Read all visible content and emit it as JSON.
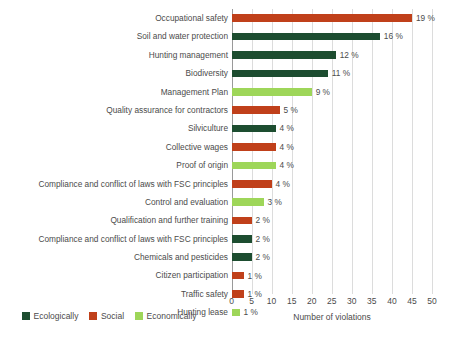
{
  "chart_data": {
    "type": "bar",
    "orientation": "horizontal",
    "title": "",
    "xlabel": "Number of violations",
    "ylabel": "",
    "xlim": [
      0,
      50
    ],
    "xticks": [
      0,
      5,
      10,
      15,
      20,
      25,
      30,
      35,
      40,
      45,
      50
    ],
    "grid": true,
    "legend_position": "bottom-left",
    "categories": [
      "Occupational safety",
      "Soil and water protection",
      "Hunting management",
      "Biodiversity",
      "Management Plan",
      "Quality assurance for contractors",
      "Silviculture",
      "Collective wages",
      "Proof of origin",
      "Compliance and conflict of laws with FSC principles",
      "Control and evaluation",
      "Qualification and further training",
      "Compliance and conflict of laws with FSC principles",
      "Chemicals and pesticides",
      "Citizen participation",
      "Traffic safety",
      "Hunting lease"
    ],
    "values": [
      45,
      37,
      26,
      24,
      20,
      12,
      11,
      11,
      11,
      10,
      8,
      5,
      5,
      5,
      3,
      3,
      2
    ],
    "data_labels": [
      "19 %",
      "16 %",
      "12 %",
      "11 %",
      "9 %",
      "5 %",
      "4 %",
      "4 %",
      "4 %",
      "4 %",
      "3 %",
      "2 %",
      "2 %",
      "2 %",
      "1 %",
      "1 %",
      "1 %"
    ],
    "group_by_bar": [
      "social",
      "ecologically",
      "ecologically",
      "ecologically",
      "economically",
      "social",
      "ecologically",
      "social",
      "economically",
      "social",
      "economically",
      "social",
      "ecologically",
      "ecologically",
      "social",
      "social",
      "economically"
    ],
    "series": [
      {
        "name": "Ecologically",
        "color": "#1d4d30",
        "points": [
          {
            "category": "Soil and water protection",
            "value": 37,
            "label": "16 %"
          },
          {
            "category": "Hunting management",
            "value": 26,
            "label": "12 %"
          },
          {
            "category": "Biodiversity",
            "value": 24,
            "label": "11 %"
          },
          {
            "category": "Silviculture",
            "value": 11,
            "label": "4 %"
          },
          {
            "category": "Compliance and conflict of laws with FSC principles",
            "value": 5,
            "label": "2 %"
          },
          {
            "category": "Chemicals and pesticides",
            "value": 5,
            "label": "2 %"
          }
        ]
      },
      {
        "name": "Social",
        "color": "#c0401a",
        "points": [
          {
            "category": "Occupational safety",
            "value": 45,
            "label": "19 %"
          },
          {
            "category": "Quality assurance for contractors",
            "value": 12,
            "label": "5 %"
          },
          {
            "category": "Collective wages",
            "value": 11,
            "label": "4 %"
          },
          {
            "category": "Compliance and conflict of laws with FSC principles",
            "value": 10,
            "label": "4 %"
          },
          {
            "category": "Qualification and further training",
            "value": 5,
            "label": "2 %"
          },
          {
            "category": "Citizen participation",
            "value": 3,
            "label": "1 %"
          },
          {
            "category": "Traffic safety",
            "value": 3,
            "label": "1 %"
          }
        ]
      },
      {
        "name": "Economically",
        "color": "#9ed659",
        "points": [
          {
            "category": "Management Plan",
            "value": 20,
            "label": "9 %"
          },
          {
            "category": "Proof of origin",
            "value": 11,
            "label": "4 %"
          },
          {
            "category": "Control and evaluation",
            "value": 8,
            "label": "3 %"
          },
          {
            "category": "Hunting lease",
            "value": 2,
            "label": "1 %"
          }
        ]
      }
    ]
  },
  "legend": {
    "items": [
      {
        "label": "Ecologically",
        "color": "#1d4d30"
      },
      {
        "label": "Social",
        "color": "#c0401a"
      },
      {
        "label": "Economically",
        "color": "#9ed659"
      }
    ]
  },
  "axis": {
    "title": "Number of violations",
    "tick_labels": [
      "0",
      "5",
      "10",
      "15",
      "20",
      "25",
      "30",
      "35",
      "40",
      "45",
      "50"
    ]
  },
  "colors": {
    "ecologically": "#1d4d30",
    "social": "#c0401a",
    "economically": "#9ed659",
    "gridline": "#dcdcdc",
    "axis": "#9a9a9a",
    "text": "#4b4b4b",
    "background": "#ffffff"
  }
}
